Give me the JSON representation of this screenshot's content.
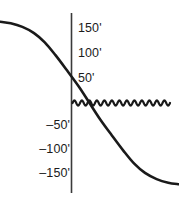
{
  "chart_data": {
    "type": "line",
    "title": "",
    "xlabel": "",
    "ylabel": "",
    "ylim": [
      -175,
      175
    ],
    "xlim": [
      -1,
      1
    ],
    "grid": false,
    "legend": null,
    "axis": {
      "vertical_axis_at_x": 0,
      "tick_unit": "feet",
      "tick_suffix": "'"
    },
    "tick_labels_positive": [
      {
        "value": 150,
        "text": "150'"
      },
      {
        "value": 100,
        "text": "100'"
      },
      {
        "value": 50,
        "text": "50'"
      }
    ],
    "tick_labels_negative": [
      {
        "value": -50,
        "text": "–50'"
      },
      {
        "value": -100,
        "text": "–100'"
      },
      {
        "value": -150,
        "text": "–150'"
      }
    ],
    "series": [
      {
        "name": "sigmoid-descending-curve",
        "description": "Smooth S-shaped curve descending from +150' at far left through 0' at the vertical axis to -150' at far right",
        "color": "#1a1a1a",
        "points": [
          {
            "x": -1.0,
            "y": 158
          },
          {
            "x": -0.88,
            "y": 155
          },
          {
            "x": -0.75,
            "y": 148
          },
          {
            "x": -0.62,
            "y": 136
          },
          {
            "x": -0.5,
            "y": 118
          },
          {
            "x": -0.38,
            "y": 93
          },
          {
            "x": -0.25,
            "y": 63
          },
          {
            "x": -0.12,
            "y": 32
          },
          {
            "x": 0.0,
            "y": 0
          },
          {
            "x": 0.12,
            "y": -32
          },
          {
            "x": 0.25,
            "y": -63
          },
          {
            "x": 0.38,
            "y": -93
          },
          {
            "x": 0.5,
            "y": -118
          },
          {
            "x": 0.62,
            "y": -136
          },
          {
            "x": 0.75,
            "y": -148
          },
          {
            "x": 0.88,
            "y": -155
          },
          {
            "x": 1.0,
            "y": -158
          }
        ]
      },
      {
        "name": "zero-level-squiggle",
        "description": "Small-amplitude sinusoidal squiggle along the 0' level extending to the right of the axis",
        "color": "#1a1a1a",
        "baseline_value": 0,
        "amplitude_feet": 5,
        "cycles": 13,
        "x_start": 0.0,
        "x_end": 1.0
      }
    ],
    "colors": {
      "curve": "#1a1a1a",
      "axis": "#3a3a3a",
      "text": "#1b1b1b",
      "background": "#ffffff"
    }
  }
}
